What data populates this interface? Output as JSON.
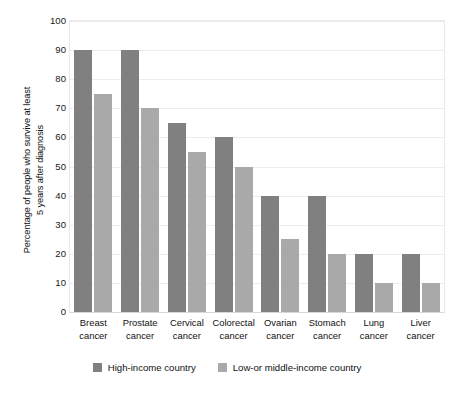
{
  "chart_data": {
    "type": "bar",
    "title": "",
    "subtitle": "",
    "xlabel": "",
    "ylabel": "Percentage of people who survive at least\n5 years after diagnosis",
    "ylim": [
      0,
      100
    ],
    "yticks": [
      100,
      90,
      80,
      70,
      60,
      50,
      40,
      30,
      20,
      10,
      0
    ],
    "grid": true,
    "legend_position": "bottom-center",
    "categories": [
      "Breast\ncancer",
      "Prostate\ncancer",
      "Cervical\ncancer",
      "Colorectal\ncancer",
      "Ovarian\ncancer",
      "Stomach\ncancer",
      "Lung\ncancer",
      "Liver\ncancer"
    ],
    "series": [
      {
        "name": "High-income country",
        "color": "#808080",
        "values": [
          90,
          90,
          65,
          60,
          40,
          40,
          20,
          20
        ]
      },
      {
        "name": "Low-or middle-income country",
        "color": "#a9a9a9",
        "values": [
          75,
          70,
          55,
          50,
          25,
          20,
          10,
          10
        ]
      }
    ]
  },
  "legend": {
    "items": [
      {
        "label": "High-income country"
      },
      {
        "label": "Low-or middle-income country"
      }
    ]
  }
}
